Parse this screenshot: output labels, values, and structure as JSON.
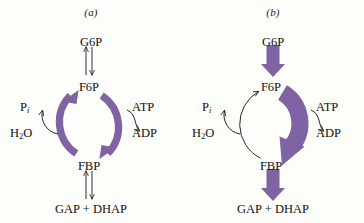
{
  "figure": {
    "type": "diagram",
    "accent_color": "#7f63a3",
    "accent_color_dark": "#6b5190",
    "line_color": "#1a1a1a",
    "background": "#fdfdfa"
  },
  "panels": [
    {
      "id": "a",
      "title": "(a)",
      "top_metabolite": "G6P",
      "upper_node": "F6P",
      "lower_node": "FBP",
      "bottom_metabolite": "GAP + DHAP",
      "left_inputs": {
        "product": "P",
        "product_subscript": "i",
        "substrate": "H",
        "substrate_sub": "2",
        "substrate_tail": "O"
      },
      "right_inputs": {
        "substrate": "ATP",
        "product": "ADP"
      },
      "top_arrow_style": "reversible-thin-pair",
      "bottom_arrow_style": "reversible-thin-pair",
      "left_arc_style": "thick-purple",
      "right_arc_style": "thick-purple",
      "left_arc_direction": "FBP-to-F6P",
      "right_arc_direction": "F6P-to-FBP"
    },
    {
      "id": "b",
      "title": "(b)",
      "top_metabolite": "G6P",
      "upper_node": "F6P",
      "lower_node": "FBP",
      "bottom_metabolite": "GAP + DHAP",
      "left_inputs": {
        "product": "P",
        "product_subscript": "i",
        "substrate": "H",
        "substrate_sub": "2",
        "substrate_tail": "O"
      },
      "right_inputs": {
        "substrate": "ATP",
        "product": "ADP"
      },
      "top_arrow_style": "thick-purple-block-down",
      "bottom_arrow_style": "thick-purple-block-down",
      "left_arc_style": "thin-black",
      "right_arc_style": "very-thick-purple",
      "left_arc_direction": "FBP-to-F6P",
      "right_arc_direction": "F6P-to-FBP"
    }
  ]
}
